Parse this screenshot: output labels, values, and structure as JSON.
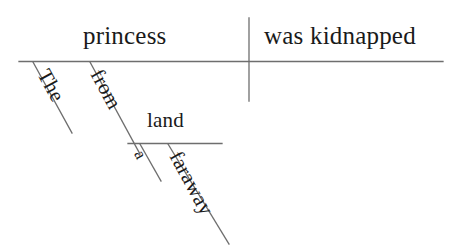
{
  "diagram": {
    "type": "reed-kellogg-sentence-diagram",
    "sentence": "The princess from a faraway land was kidnapped",
    "ink_color": "#1a1a1a",
    "rule_color": "#6e6e6e",
    "background_color": "#ffffff",
    "baseline": {
      "subject": "princess",
      "predicate": "was kidnapped",
      "divider": "vertical-bar"
    },
    "modifiers": [
      {
        "id": "the",
        "text": "The",
        "attaches_to": "princess",
        "kind": "article"
      },
      {
        "id": "from",
        "text": "from",
        "attaches_to": "princess",
        "kind": "preposition"
      },
      {
        "id": "land",
        "text": "land",
        "attaches_to": "from",
        "kind": "object-of-preposition"
      },
      {
        "id": "a",
        "text": "a",
        "attaches_to": "land",
        "kind": "article"
      },
      {
        "id": "faraway",
        "text": "faraway",
        "attaches_to": "land",
        "kind": "adjective"
      }
    ],
    "labels": {
      "princess": "princess",
      "predicate": "was kidnapped",
      "the": "The",
      "from": "from",
      "land": "land",
      "a": "a",
      "faraway": "faraway"
    }
  }
}
